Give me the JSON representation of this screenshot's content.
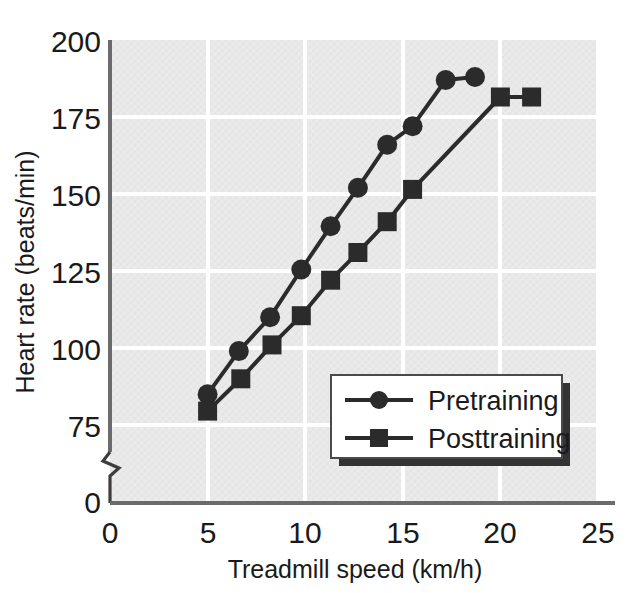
{
  "chart_data": {
    "type": "line",
    "title": "",
    "xlabel": "Treadmill speed (km/h)",
    "ylabel": "Heart rate (beats/min)",
    "xlim": [
      0,
      25
    ],
    "ylim": [
      75,
      200
    ],
    "y_axis_break": true,
    "y_axis_break_note": "axis broken between 0 and 75",
    "xticks": [
      "0",
      "5",
      "10",
      "15",
      "20",
      "25"
    ],
    "yticks": [
      "200",
      "175",
      "150",
      "125",
      "100",
      "75",
      "0"
    ],
    "grid": true,
    "legend_position": "lower-right-inside",
    "series": [
      {
        "name": "Pretraining",
        "marker": "circle",
        "color": "#2b2b2b",
        "points": [
          {
            "x": 5.0,
            "y": 85
          },
          {
            "x": 6.6,
            "y": 99
          },
          {
            "x": 8.2,
            "y": 110
          },
          {
            "x": 9.8,
            "y": 125.5
          },
          {
            "x": 11.3,
            "y": 139.5
          },
          {
            "x": 12.7,
            "y": 152
          },
          {
            "x": 14.2,
            "y": 166
          },
          {
            "x": 15.5,
            "y": 172
          },
          {
            "x": 17.2,
            "y": 187
          },
          {
            "x": 18.7,
            "y": 188
          }
        ]
      },
      {
        "name": "Posttraining",
        "marker": "square",
        "color": "#2b2b2b",
        "points": [
          {
            "x": 5.0,
            "y": 79.5
          },
          {
            "x": 6.7,
            "y": 90
          },
          {
            "x": 8.3,
            "y": 101
          },
          {
            "x": 9.8,
            "y": 110.5
          },
          {
            "x": 11.3,
            "y": 122
          },
          {
            "x": 12.7,
            "y": 131
          },
          {
            "x": 14.2,
            "y": 141
          },
          {
            "x": 15.5,
            "y": 151.5
          },
          {
            "x": 20.0,
            "y": 181.5
          },
          {
            "x": 21.6,
            "y": 181.5
          }
        ]
      }
    ]
  },
  "axes": {
    "xlabel": "Treadmill speed (km/h)",
    "ylabel": "Heart rate (beats/min)",
    "xticks": [
      {
        "label": "0",
        "value": 0
      },
      {
        "label": "5",
        "value": 5
      },
      {
        "label": "10",
        "value": 10
      },
      {
        "label": "15",
        "value": 15
      },
      {
        "label": "20",
        "value": 20
      },
      {
        "label": "25",
        "value": 25
      }
    ],
    "yticks": [
      {
        "label": "200",
        "value": 200
      },
      {
        "label": "175",
        "value": 175
      },
      {
        "label": "150",
        "value": 150
      },
      {
        "label": "125",
        "value": 125
      },
      {
        "label": "100",
        "value": 100
      },
      {
        "label": "75",
        "value": 75
      },
      {
        "label": "0",
        "value": 0
      }
    ]
  },
  "legend": {
    "entries": [
      {
        "label": "Pretraining",
        "marker": "circle-marker"
      },
      {
        "label": "Posttraining",
        "marker": "square-marker"
      }
    ]
  },
  "colors": {
    "plot_background": "#e9e9e9",
    "gridline": "#ffffff",
    "axis": "#6b6b6b",
    "series": "#2b2b2b",
    "text": "#1a1a1a",
    "legend_background": "#ffffff",
    "legend_shadow": "#333333"
  }
}
